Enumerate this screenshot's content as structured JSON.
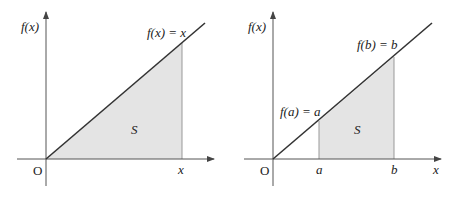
{
  "figures": [
    {
      "id": "left",
      "y_axis_label": "f(x)",
      "x_axis_label": "x",
      "origin_label": "O",
      "line_label": "f(x) = x",
      "region_label": "S",
      "x_tick_labels": [
        "x"
      ]
    },
    {
      "id": "right",
      "y_axis_label": "f(x)",
      "x_axis_label": "x",
      "origin_label": "O",
      "point_a_label": "f(a) = a",
      "point_b_label": "f(b) = b",
      "region_label": "S",
      "x_tick_labels": [
        "a",
        "b"
      ]
    }
  ],
  "colors": {
    "fill": "#e4e4e4",
    "line": "#333333",
    "axis": "#555555"
  }
}
